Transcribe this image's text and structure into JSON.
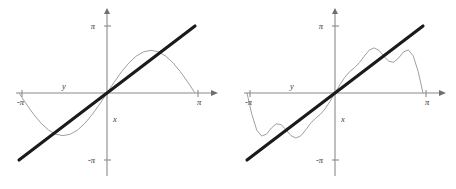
{
  "figure": {
    "background": "#ffffff",
    "panel_count": 2
  },
  "style": {
    "axis_color": "#8a8a8a",
    "target_line_color": "#1a1a1a",
    "approx_curve_color": "#9a9a9a",
    "label_color": "#2e2e2e"
  },
  "chart_data": [
    {
      "type": "line",
      "title": "",
      "xlabel": "y",
      "ylabel": "x",
      "xlim": [
        -3.14159,
        3.14159
      ],
      "ylim": [
        -3.14159,
        3.14159
      ],
      "grid": false,
      "legend": "none",
      "x_tick_labels": [
        "-π",
        "π"
      ],
      "x_tick_values": [
        -3.14159,
        3.14159
      ],
      "y_tick_labels": [
        "π",
        "-π"
      ],
      "y_tick_values": [
        3.14159,
        -3.14159
      ],
      "annotations": [
        "y",
        "x"
      ],
      "series": [
        {
          "name": "f(x) = x",
          "style": "thick-black-line",
          "x": [
            -3.14159,
            3.14159
          ],
          "values": [
            -3.14159,
            3.14159
          ]
        },
        {
          "name": "Fourier partial sum, 1 term: 2 sin(x)",
          "style": "thin-gray-curve",
          "terms": 1,
          "x": [
            -3.14159,
            -2.87979,
            -2.61799,
            -2.35619,
            -2.0944,
            -1.8326,
            -1.5708,
            -1.309,
            -1.0472,
            -0.7854,
            -0.5236,
            -0.2618,
            0,
            0.2618,
            0.5236,
            0.7854,
            1.0472,
            1.309,
            1.5708,
            1.8326,
            2.0944,
            2.35619,
            2.61799,
            2.87979,
            3.14159
          ],
          "values": [
            0,
            -0.5176,
            -1.0,
            -1.4142,
            -1.7321,
            -1.9319,
            -2.0,
            -1.9319,
            -1.7321,
            -1.4142,
            -1.0,
            -0.5176,
            0,
            0.5176,
            1.0,
            1.4142,
            1.7321,
            1.9319,
            2.0,
            1.9319,
            1.7321,
            1.4142,
            1.0,
            0.5176,
            0
          ]
        }
      ]
    },
    {
      "type": "line",
      "title": "",
      "xlabel": "y",
      "ylabel": "x",
      "xlim": [
        -3.14159,
        3.14159
      ],
      "ylim": [
        -3.14159,
        3.14159
      ],
      "grid": false,
      "legend": "none",
      "x_tick_labels": [
        "-π",
        "π"
      ],
      "x_tick_values": [
        -3.14159,
        3.14159
      ],
      "y_tick_labels": [
        "π",
        "-π"
      ],
      "y_tick_values": [
        3.14159,
        -3.14159
      ],
      "annotations": [
        "y",
        "x"
      ],
      "series": [
        {
          "name": "f(x) = x",
          "style": "thick-black-line",
          "x": [
            -3.14159,
            3.14159
          ],
          "values": [
            -3.14159,
            3.14159
          ]
        },
        {
          "name": "Fourier partial sum, 3 terms: 2 sin(x) - sin(2x) + (2/3) sin(3x)",
          "style": "thin-gray-curve",
          "terms": 3,
          "x": [
            -3.14159,
            -2.96706,
            -2.79253,
            -2.61799,
            -2.44346,
            -2.26893,
            -2.0944,
            -1.91986,
            -1.74533,
            -1.5708,
            -1.39626,
            -1.22173,
            -1.0472,
            -0.87266,
            -0.69813,
            -0.5236,
            -0.34907,
            -0.17453,
            0,
            0.17453,
            0.34907,
            0.5236,
            0.69813,
            0.87266,
            1.0472,
            1.22173,
            1.39626,
            1.5708,
            1.74533,
            1.91986,
            2.0944,
            2.26893,
            2.44346,
            2.61799,
            2.79253,
            2.96706,
            3.14159
          ],
          "values": [
            0,
            -1.0134,
            -1.7412,
            -2.0207,
            -1.9246,
            -1.6378,
            -1.4434,
            -1.4849,
            -1.7295,
            -2.0,
            -2.1137,
            -2.0078,
            -1.7321,
            -1.4251,
            -1.1907,
            -1.0,
            -0.7351,
            -0.3862,
            0,
            0.3862,
            0.7351,
            1.0,
            1.1907,
            1.4251,
            1.7321,
            2.0078,
            2.1137,
            2.0,
            1.7295,
            1.4849,
            1.4434,
            1.6378,
            1.9246,
            2.0207,
            1.7412,
            1.0134,
            0
          ]
        }
      ]
    }
  ]
}
